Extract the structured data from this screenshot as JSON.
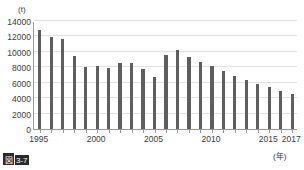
{
  "figure": {
    "caption_prefix": "図",
    "caption_number": "3-7",
    "caption_full": "図3-7"
  },
  "chart_data": {
    "type": "bar",
    "title": "",
    "subtitle": "",
    "xlabel": "(年)",
    "ylabel": "(t)",
    "ylim": [
      0,
      14000
    ],
    "ytick_values": [
      0,
      2000,
      4000,
      6000,
      8000,
      10000,
      12000,
      14000
    ],
    "ytick_labels": [
      "0",
      "2000",
      "4000",
      "6000",
      "8000",
      "10000",
      "12000",
      "14000"
    ],
    "xtick_labels": [
      "1995",
      "2000",
      "2005",
      "2010",
      "2015",
      "2017"
    ],
    "xtick_values": [
      1995,
      2000,
      2005,
      2010,
      2015,
      2017
    ],
    "grid": true,
    "legend": false,
    "legend_position": "none",
    "bar_color": "#5e5e5e",
    "axis_color": "#9a9a9a",
    "grid_color": "#e2e2e2",
    "categories": [
      "1995",
      "1996",
      "1997",
      "1998",
      "1999",
      "2000",
      "2001",
      "2002",
      "2003",
      "2004",
      "2005",
      "2006",
      "2007",
      "2008",
      "2009",
      "2010",
      "2011",
      "2012",
      "2013",
      "2014",
      "2015",
      "2016",
      "2017"
    ],
    "values": [
      12900,
      11900,
      11700,
      9500,
      8000,
      8200,
      7900,
      8600,
      8500,
      7800,
      6800,
      9600,
      10300,
      9400,
      8700,
      8200,
      7500,
      6900,
      6400,
      5800,
      5400,
      4900,
      4600
    ]
  }
}
